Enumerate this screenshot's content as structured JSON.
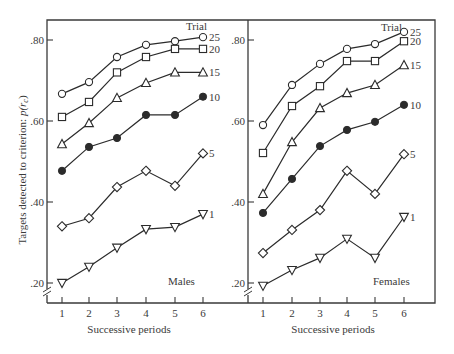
{
  "chart_data": {
    "type": "line",
    "ylabel": "Targets detected to criterion: p(r_c)",
    "ylabel_main": "Targets detected to criterion: ",
    "ylabel_sym": "p(r",
    "ylabel_sub": "c",
    "ylabel_close": ")",
    "ylim": [
      0.2,
      0.8
    ],
    "y_ticks": [
      ".20",
      ".40",
      ".60",
      ".80"
    ],
    "y_tick_values": [
      0.2,
      0.4,
      0.6,
      0.8
    ],
    "x_ticks": [
      "1",
      "2",
      "3",
      "4",
      "5",
      "6"
    ],
    "legend_title": "Trial",
    "grid": false,
    "axis_break": true,
    "panels": [
      {
        "name": "Males",
        "label": "Males",
        "xlabel": "Successive periods",
        "series": [
          {
            "name": "25",
            "marker": "circle-open",
            "values": [
              0.667,
              0.696,
              0.758,
              0.788,
              0.797,
              0.807
            ]
          },
          {
            "name": "20",
            "marker": "square-open",
            "values": [
              0.61,
              0.647,
              0.72,
              0.758,
              0.778,
              0.778
            ]
          },
          {
            "name": "15",
            "marker": "triangle-up",
            "values": [
              0.543,
              0.595,
              0.657,
              0.694,
              0.72,
              0.72
            ]
          },
          {
            "name": "10",
            "marker": "circle-filled",
            "values": [
              0.477,
              0.536,
              0.558,
              0.615,
              0.615,
              0.66
            ]
          },
          {
            "name": "5",
            "marker": "diamond-open",
            "values": [
              0.34,
              0.36,
              0.437,
              0.477,
              0.44,
              0.52
            ]
          },
          {
            "name": "1",
            "marker": "triangle-down",
            "values": [
              0.2,
              0.24,
              0.287,
              0.333,
              0.338,
              0.37
            ]
          }
        ]
      },
      {
        "name": "Females",
        "label": "Females",
        "xlabel": "Successive periods",
        "series": [
          {
            "name": "25",
            "marker": "circle-open",
            "values": [
              0.59,
              0.689,
              0.741,
              0.778,
              0.79,
              0.82
            ]
          },
          {
            "name": "20",
            "marker": "square-open",
            "values": [
              0.521,
              0.637,
              0.686,
              0.748,
              0.748,
              0.797
            ]
          },
          {
            "name": "15",
            "marker": "triangle-up",
            "values": [
              0.42,
              0.548,
              0.632,
              0.669,
              0.689,
              0.738
            ]
          },
          {
            "name": "10",
            "marker": "circle-filled",
            "values": [
              0.373,
              0.457,
              0.538,
              0.578,
              0.598,
              0.64
            ]
          },
          {
            "name": "5",
            "marker": "diamond-open",
            "values": [
              0.274,
              0.331,
              0.38,
              0.477,
              0.42,
              0.518
            ]
          },
          {
            "name": "1",
            "marker": "triangle-down",
            "values": [
              0.193,
              0.232,
              0.262,
              0.309,
              0.262,
              0.363
            ]
          }
        ]
      }
    ]
  },
  "style": {
    "line_color": "#2b2b2b",
    "frame_color": "#3a3a3a",
    "background": "#ffffff"
  }
}
